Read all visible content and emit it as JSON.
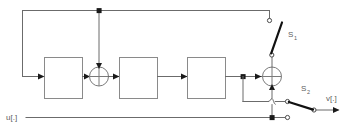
{
  "figure": {
    "kind": "control-system-block-diagram",
    "background_color": "#ffffff",
    "wire_color": "#6b6b6b",
    "accent_color": "#111111",
    "label_color": "#5d5d5d",
    "width": 355,
    "height": 132
  },
  "signals": {
    "input_label": "u[.]",
    "output_label": "v[.]"
  },
  "switches": [
    {
      "id": "S1",
      "label": "S",
      "subscript": "1",
      "state": "open",
      "orientation": "vertical"
    },
    {
      "id": "S2",
      "label": "S",
      "subscript": "2",
      "state": "open",
      "orientation": "horizontal"
    }
  ],
  "blocks": [
    {
      "id": "block-1",
      "label": ""
    },
    {
      "id": "block-2",
      "label": ""
    },
    {
      "id": "block-3",
      "label": ""
    }
  ],
  "summing_junctions": [
    {
      "id": "sum-left",
      "label": ""
    },
    {
      "id": "sum-right",
      "label": ""
    }
  ]
}
